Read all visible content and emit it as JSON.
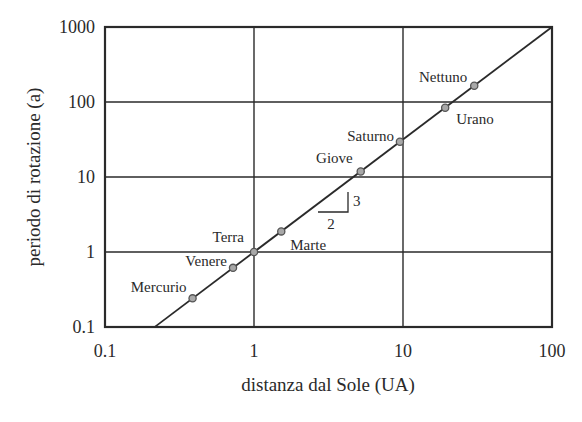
{
  "chart_data": {
    "type": "scatter",
    "title": "",
    "xlabel": "distanza dal Sole (UA)",
    "ylabel": "periodo di rotazione (a)",
    "xscale": "log",
    "yscale": "log",
    "xlim": [
      0.1,
      100
    ],
    "ylim": [
      0.1,
      1000
    ],
    "grid": true,
    "legend": null,
    "x_ticks": [
      "0.1",
      "1",
      "10",
      "100"
    ],
    "y_ticks": [
      "0.1",
      "1",
      "10",
      "100",
      "1000"
    ],
    "series": [
      {
        "name": "Pianeti",
        "points": [
          {
            "label": "Mercurio",
            "x": 0.387,
            "y": 0.241
          },
          {
            "label": "Venere",
            "x": 0.723,
            "y": 0.615
          },
          {
            "label": "Terra",
            "x": 1.0,
            "y": 1.0
          },
          {
            "label": "Marte",
            "x": 1.524,
            "y": 1.881
          },
          {
            "label": "Giove",
            "x": 5.203,
            "y": 11.86
          },
          {
            "label": "Saturno",
            "x": 9.537,
            "y": 29.46
          },
          {
            "label": "Urano",
            "x": 19.19,
            "y": 84.01
          },
          {
            "label": "Nettuno",
            "x": 30.07,
            "y": 164.8
          }
        ]
      }
    ],
    "fit_line": {
      "description": "T = a^(3/2)",
      "slope": 1.5,
      "x_range": [
        0.215,
        100
      ]
    },
    "annotations": [
      {
        "type": "slope-triangle",
        "run_label": "2",
        "rise_label": "3"
      }
    ]
  },
  "colors": {
    "line": "#2a2a2a",
    "grid": "#2a2a2a",
    "marker_fill": "#a8a8a8",
    "marker_stroke": "#555555",
    "text": "#2a2a2a"
  }
}
